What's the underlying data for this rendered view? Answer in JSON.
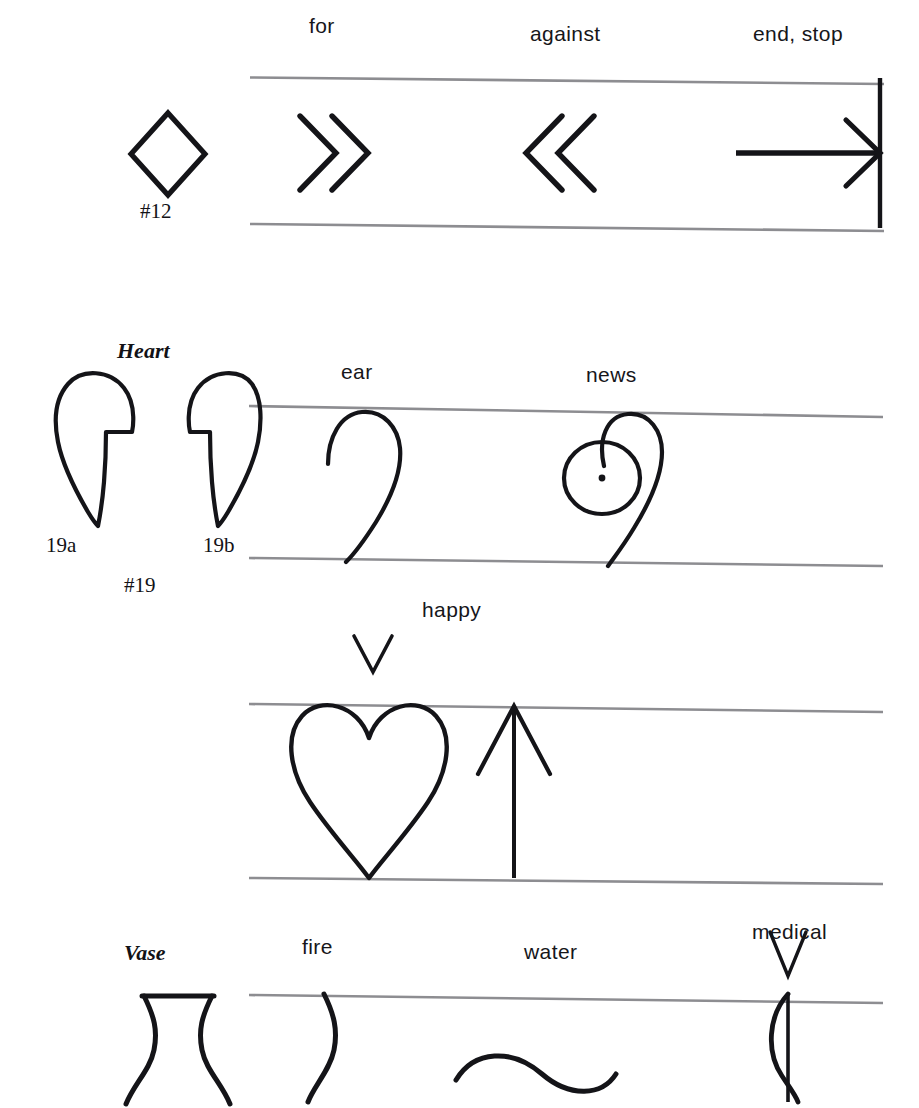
{
  "page": {
    "background_color": "#ffffff",
    "ink_color": "#141418",
    "staff_line_color": "#8d8d91"
  },
  "rows": [
    {
      "id": "row-1",
      "reference_symbol": {
        "name": "diamond",
        "caption": "#12"
      },
      "staff_symbols": [
        {
          "name": "double-chevron-right",
          "label": "for"
        },
        {
          "name": "double-chevron-left",
          "label": "against"
        },
        {
          "name": "arrow-to-bar",
          "label": "end, stop"
        }
      ]
    },
    {
      "id": "row-2",
      "reference_symbol": {
        "name": "half-heart-pair",
        "title": "Heart",
        "caption": "#19",
        "sub_labels": [
          "19a",
          "19b"
        ]
      },
      "staff_symbols": [
        {
          "name": "half-heart-curve",
          "label": "ear"
        },
        {
          "name": "half-heart-with-circle-dot",
          "label": "news"
        }
      ]
    },
    {
      "id": "row-3",
      "staff_symbols": [
        {
          "name": "full-heart",
          "label": "happy",
          "accent": "v-mark"
        },
        {
          "name": "up-arrow",
          "label": ""
        }
      ]
    },
    {
      "id": "row-4",
      "reference_symbol": {
        "name": "vase",
        "title": "Vase"
      },
      "staff_symbols": [
        {
          "name": "vase-right-half",
          "label": "fire"
        },
        {
          "name": "horizontal-s-curve",
          "label": "water"
        },
        {
          "name": "stem-with-bow",
          "label": "medical",
          "accent": "v-mark"
        }
      ]
    }
  ],
  "labels": {
    "for": "for",
    "against": "against",
    "end_stop": "end, stop",
    "hash12": "#12",
    "heart": "Heart",
    "n19a": "19a",
    "n19b": "19b",
    "hash19": "#19",
    "ear": "ear",
    "news": "news",
    "happy": "happy",
    "vase": "Vase",
    "fire": "fire",
    "water": "water",
    "medical": "medical"
  }
}
